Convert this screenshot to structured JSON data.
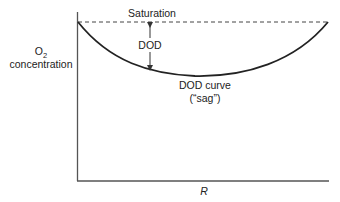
{
  "diagram": {
    "type": "oxygen-sag-curve",
    "y_axis": {
      "label_line1": "O",
      "label_subscript": "2",
      "label_line2": "concentration"
    },
    "x_axis": {
      "label": "R"
    },
    "saturation_label": "Saturation",
    "deficit_label": "DOD",
    "curve_label_line1": "DOD curve",
    "curve_label_line2": "(“sag”)",
    "colors": {
      "axis": "#555555",
      "curve": "#222222",
      "saturation_line": "#444444",
      "text": "#222222"
    }
  }
}
